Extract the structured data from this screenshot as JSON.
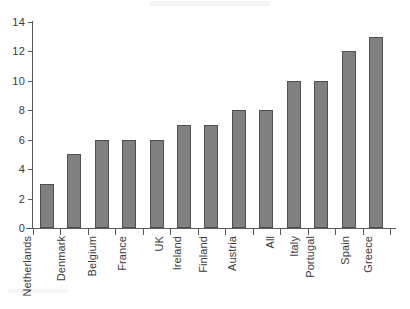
{
  "chart_data": {
    "type": "bar",
    "title": "",
    "subtitle": "",
    "xlabel": "",
    "ylabel": "",
    "categories": [
      "Netherlands",
      "Denmark",
      "Belgium",
      "France",
      "UK",
      "Ireland",
      "Finland",
      "Austria",
      "All",
      "Italy",
      "Portugal",
      "Spain",
      "Greece"
    ],
    "values": [
      3,
      5,
      6,
      6,
      6,
      7,
      7,
      8,
      8,
      10,
      10,
      12,
      13
    ],
    "ylim": [
      0,
      14
    ],
    "ytick_labels": [
      "0",
      "2",
      "4",
      "6",
      "8",
      "10",
      "12",
      "14"
    ],
    "ytick_values": [
      0,
      2,
      4,
      6,
      8,
      10,
      12,
      14
    ],
    "grid": false,
    "legend": false,
    "legend_position": "none",
    "bar_color": "#808080",
    "bar_edge_color": "#4f4f4f",
    "axis_color": "#5a5a5a",
    "background_color": "#ffffff",
    "xtick_style": "between-bars",
    "xlabel_rotation_degrees": 90
  }
}
